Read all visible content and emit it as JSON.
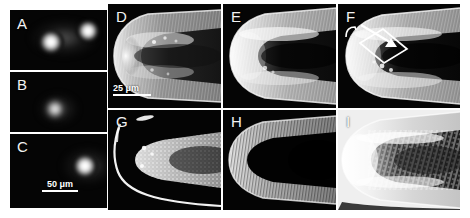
{
  "figure": {
    "kind": "multi-panel-micrograph",
    "panel_count": 9,
    "background_color": "#ffffff",
    "panel_background_color": "#050505",
    "label_color": "#f2f2f2",
    "separator_color": "#ffffff",
    "annotation_color": "#ffffff"
  },
  "panels": [
    {
      "id": "A",
      "label": "A",
      "column": "left",
      "row": 1,
      "modality": "fluorescence",
      "description": "two bright rounded fluorescent spots on black background",
      "spot_count": 2
    },
    {
      "id": "B",
      "label": "B",
      "column": "left",
      "row": 2,
      "modality": "fluorescence",
      "description": "single small bright fluorescent spot on black background",
      "spot_count": 1
    },
    {
      "id": "C",
      "label": "C",
      "column": "left",
      "row": 3,
      "modality": "fluorescence",
      "description": "single bright fluorescent spot at right on black background",
      "spot_count": 1
    },
    {
      "id": "D",
      "label": "D",
      "column": 1,
      "row": "top",
      "modality": "root-tip-micrograph",
      "description": "root apex, moderate brightness, striated cortex"
    },
    {
      "id": "E",
      "label": "E",
      "column": 2,
      "row": "top",
      "modality": "root-tip-micrograph",
      "description": "root apex, bright outer layers, dark central stele"
    },
    {
      "id": "F",
      "label": "F",
      "column": 3,
      "row": "top",
      "modality": "root-tip-micrograph",
      "description": "root apex with boxed region of interest and arrow"
    },
    {
      "id": "G",
      "label": "G",
      "column": 1,
      "row": "bottom",
      "modality": "root-tip-micrograph",
      "description": "dark-field root apex, thin bright epidermal outline and speckled signal"
    },
    {
      "id": "H",
      "label": "H",
      "column": 2,
      "row": "bottom",
      "modality": "root-tip-micrograph",
      "description": "root apex, bright U-shaped outer layer, fully dark interior"
    },
    {
      "id": "I",
      "label": "I",
      "column": 3,
      "row": "bottom",
      "modality": "root-tip-micrograph",
      "description": "root apex, very bright halo with dark mottled core"
    }
  ],
  "scale_bars": [
    {
      "id": "scalebar-50um",
      "panel": "C",
      "text": "50 μm",
      "length_px": 36,
      "color": "#ffffff"
    },
    {
      "id": "scalebar-25um",
      "panel": "D",
      "text": "25 μm",
      "length_px": 38,
      "color": "#ffffff"
    }
  ],
  "annotations": [
    {
      "id": "roi-box",
      "panel": "F",
      "shape": "parallelogram",
      "stroke": "#ffffff",
      "filled": false,
      "description": "white outlined quadrilateral marking region of interest"
    },
    {
      "id": "roi-arrow",
      "panel": "F",
      "shape": "arrow",
      "stroke": "#ffffff",
      "direction": "down-right",
      "description": "white arrow pointing into the boxed region"
    },
    {
      "id": "hook-mark",
      "panel": "F",
      "shape": "hook",
      "stroke": "#ffffff",
      "description": "small white hook tick at upper-left edge of root"
    },
    {
      "id": "streak-mark",
      "panel": "G",
      "shape": "streak",
      "stroke": "#ffffff",
      "description": "small bright elongated streak above the root tip"
    }
  ]
}
